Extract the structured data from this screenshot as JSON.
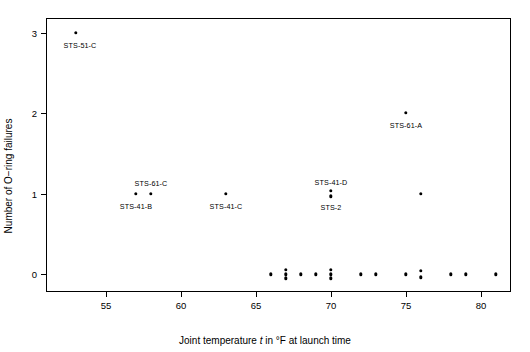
{
  "chart_data": {
    "type": "scatter",
    "title": "",
    "xlabel": "Joint temperature t in °F at launch time",
    "ylabel": "Number of O−ring failures",
    "xlabel_parts": {
      "before": "Joint temperature ",
      "italic": "t",
      "after": " in °F at launch time"
    },
    "xlim": [
      51.0,
      82.0
    ],
    "ylim": [
      -0.22,
      3.18
    ],
    "xticks": [
      55,
      60,
      65,
      70,
      75,
      80
    ],
    "xtick_labels": [
      "55",
      "60",
      "65",
      "70",
      "75",
      "80"
    ],
    "yticks": [
      0,
      1,
      2,
      3
    ],
    "ytick_labels": [
      "0",
      "1",
      "2",
      "3"
    ],
    "grid": false,
    "legend": false,
    "points": [
      {
        "x": 53,
        "y": 3,
        "jitter": 0
      },
      {
        "x": 75,
        "y": 2,
        "jitter": 0
      },
      {
        "x": 57,
        "y": 1,
        "jitter": 0
      },
      {
        "x": 58,
        "y": 1,
        "jitter": 0
      },
      {
        "x": 63,
        "y": 1,
        "jitter": 0
      },
      {
        "x": 70,
        "y": 1,
        "jitter": 2.6
      },
      {
        "x": 70,
        "y": 1,
        "jitter": -2.6
      },
      {
        "x": 76,
        "y": 1,
        "jitter": 0
      },
      {
        "x": 66,
        "y": 0,
        "jitter": 0
      },
      {
        "x": 67,
        "y": 0,
        "jitter": 4.2
      },
      {
        "x": 67,
        "y": 0,
        "jitter": 0
      },
      {
        "x": 67,
        "y": 0,
        "jitter": -4.2
      },
      {
        "x": 68,
        "y": 0,
        "jitter": 0
      },
      {
        "x": 69,
        "y": 0,
        "jitter": 0
      },
      {
        "x": 70,
        "y": 0,
        "jitter": 4.2
      },
      {
        "x": 70,
        "y": 0,
        "jitter": 0
      },
      {
        "x": 70,
        "y": 0,
        "jitter": -4.2
      },
      {
        "x": 72,
        "y": 0,
        "jitter": 0
      },
      {
        "x": 73,
        "y": 0,
        "jitter": 0
      },
      {
        "x": 75,
        "y": 0,
        "jitter": 0
      },
      {
        "x": 76,
        "y": 0,
        "jitter": 3.2
      },
      {
        "x": 76,
        "y": 0,
        "jitter": -3.2
      },
      {
        "x": 78,
        "y": 0,
        "jitter": 0
      },
      {
        "x": 79,
        "y": 0,
        "jitter": 0
      },
      {
        "x": 81,
        "y": 0,
        "jitter": 0
      }
    ],
    "annotations": [
      {
        "text": "STS-51-C",
        "x": 53,
        "y": 3,
        "dx": 4,
        "dy": 13
      },
      {
        "text": "STS-61-A",
        "x": 75,
        "y": 2,
        "dx": 0,
        "dy": 13
      },
      {
        "text": "STS-61-C",
        "x": 58,
        "y": 1,
        "dx": 0,
        "dy": -10
      },
      {
        "text": "STS-41-B",
        "x": 57,
        "y": 1,
        "dx": 0,
        "dy": 13
      },
      {
        "text": "STS-41-C",
        "x": 63,
        "y": 1,
        "dx": 0,
        "dy": 13
      },
      {
        "text": "STS-41-D",
        "x": 70,
        "y": 1,
        "dx": 0,
        "dy": -11
      },
      {
        "text": "STS-2",
        "x": 70,
        "y": 1,
        "dx": 0,
        "dy": 14
      }
    ]
  },
  "style": {
    "axis_color": "#000000",
    "point_color": "#000000",
    "background": "#ffffff"
  }
}
